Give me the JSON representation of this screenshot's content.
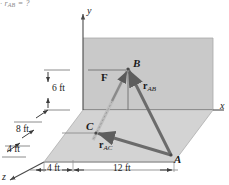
{
  "figure": {
    "title_fragment": "r",
    "top_formula": {
      "text": "· r",
      "subscript": "AB",
      "tail": " = ?"
    },
    "axes": {
      "x": "x",
      "y": "y",
      "z": "z"
    },
    "points": {
      "A": "A",
      "B": "B",
      "C": "C"
    },
    "vectors": {
      "force": "F",
      "r_ab_base": "r",
      "r_ab_sub": "AB",
      "r_ac_base": "r",
      "r_ac_sub": "AC"
    },
    "dimensions": {
      "height_6ft": "6 ft",
      "depth_8ft": "8 ft",
      "depth_4ft": "4 ft",
      "base_4ft": "4 ft",
      "base_12ft": "12 ft"
    },
    "colors": {
      "wall_plane": "#c9c9c9",
      "ground_plane": "#cfcfcf",
      "vector_stroke": "#6b6b6b",
      "axis_stroke": "#4a4a4a",
      "dim_stroke": "#6f6f6f",
      "text": "#1a1a1a"
    }
  }
}
